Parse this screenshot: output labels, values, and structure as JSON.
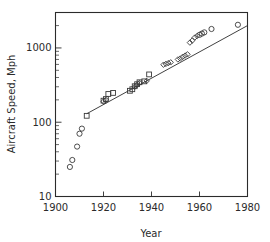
{
  "chart_data": {
    "type": "scatter",
    "title": "",
    "xlabel": "Year",
    "ylabel": "Aircraft Speed, Mph",
    "xlim": [
      1900,
      1980
    ],
    "ylim": [
      10,
      3000
    ],
    "yscale": "log",
    "xscale": "linear",
    "grid": false,
    "legend": "none",
    "xticks": [
      "1900",
      "1920",
      "1940",
      "1960",
      "1980"
    ],
    "xtick_values": [
      1900,
      1920,
      1940,
      1960,
      1980
    ],
    "yticks": [
      "10",
      "100",
      "1000"
    ],
    "ytick_values": [
      10,
      100,
      1000
    ],
    "series": [
      {
        "name": "early-aircraft",
        "marker": "circle",
        "points": [
          [
            1906,
            25
          ],
          [
            1907,
            31
          ],
          [
            1909,
            47
          ],
          [
            1910,
            70
          ],
          [
            1911,
            82
          ]
        ]
      },
      {
        "name": "piston-aircraft",
        "marker": "square",
        "points": [
          [
            1913,
            122
          ],
          [
            1920,
            195
          ],
          [
            1921,
            205
          ],
          [
            1922,
            240
          ],
          [
            1924,
            248
          ],
          [
            1931,
            265
          ],
          [
            1932,
            278
          ],
          [
            1933,
            305
          ],
          [
            1934,
            325
          ],
          [
            1935,
            345
          ],
          [
            1937,
            355
          ],
          [
            1939,
            440
          ]
        ]
      },
      {
        "name": "jet-aircraft",
        "marker": "diamond",
        "points": [
          [
            1920,
            190
          ],
          [
            1921,
            200
          ],
          [
            1933,
            300
          ],
          [
            1934,
            318
          ],
          [
            1935,
            338
          ],
          [
            1938,
            360
          ],
          [
            1945,
            595
          ],
          [
            1946,
            610
          ],
          [
            1947,
            625
          ],
          [
            1948,
            640
          ],
          [
            1951,
            700
          ],
          [
            1952,
            720
          ],
          [
            1953,
            760
          ],
          [
            1954,
            790
          ],
          [
            1955,
            820
          ],
          [
            1956,
            1180
          ],
          [
            1957,
            1260
          ],
          [
            1958,
            1380
          ],
          [
            1959,
            1450
          ]
        ]
      },
      {
        "name": "supersonic-aircraft",
        "marker": "circle",
        "points": [
          [
            1960,
            1500
          ],
          [
            1961,
            1560
          ],
          [
            1962,
            1620
          ],
          [
            1965,
            1800
          ],
          [
            1976,
            2050
          ]
        ]
      }
    ],
    "trend_line": {
      "name": "fitted-trend",
      "start": [
        1913,
        130
      ],
      "end": [
        1980,
        2000
      ]
    }
  }
}
